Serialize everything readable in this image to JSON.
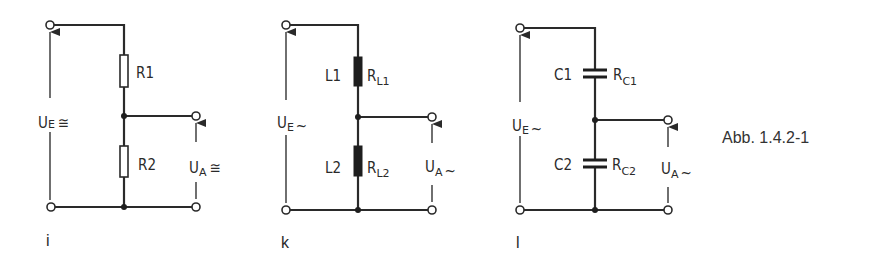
{
  "figure": {
    "caption": "Abb. 1.4.2-1",
    "colors": {
      "ink": "#2a2a2a",
      "background": "#ffffff"
    }
  },
  "circuits": [
    {
      "id": "i",
      "tag": "i",
      "type": "resistive voltage divider",
      "input": {
        "symbol": "U",
        "subscript": "E",
        "suffix": "≅"
      },
      "output": {
        "symbol": "U",
        "subscript": "A",
        "suffix": "≅"
      },
      "components": [
        {
          "name": "R1",
          "kind": "resistor",
          "label": "R1"
        },
        {
          "name": "R2",
          "kind": "resistor",
          "label": "R2"
        }
      ]
    },
    {
      "id": "k",
      "tag": "k",
      "type": "inductive voltage divider",
      "input": {
        "symbol": "U",
        "subscript": "E",
        "suffix": "~"
      },
      "output": {
        "symbol": "U",
        "subscript": "A",
        "suffix": "~"
      },
      "components": [
        {
          "name": "L1",
          "kind": "inductor",
          "label": "L1",
          "side_label": "R",
          "side_sub": "L1"
        },
        {
          "name": "L2",
          "kind": "inductor",
          "label": "L2",
          "side_label": "R",
          "side_sub": "L2"
        }
      ]
    },
    {
      "id": "l",
      "tag": "l",
      "type": "capacitive voltage divider",
      "input": {
        "symbol": "U",
        "subscript": "E",
        "suffix": "~"
      },
      "output": {
        "symbol": "U",
        "subscript": "A",
        "suffix": "~"
      },
      "components": [
        {
          "name": "C1",
          "kind": "capacitor",
          "label": "C1",
          "side_label": "R",
          "side_sub": "C1"
        },
        {
          "name": "C2",
          "kind": "capacitor",
          "label": "C2",
          "side_label": "R",
          "side_sub": "C2"
        }
      ]
    }
  ]
}
